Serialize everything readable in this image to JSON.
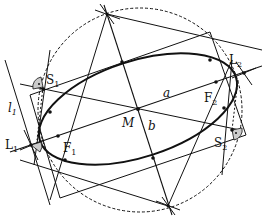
{
  "diagram": {
    "title": "",
    "colors": {
      "stroke": "#111111",
      "angle_fill": "#cccccc",
      "background": "#ffffff"
    },
    "labels": {
      "S1": {
        "main": "S",
        "sub": "1"
      },
      "S2": {
        "main": "S",
        "sub": "2"
      },
      "L1": {
        "main": "L",
        "sub": "1"
      },
      "L2": {
        "main": "L",
        "sub": "2"
      },
      "F1": {
        "main": "F",
        "sub": "1"
      },
      "F2": {
        "main": "F",
        "sub": "2"
      },
      "l1": {
        "main": "l",
        "sub": "1"
      },
      "M": "M",
      "a": "a",
      "b": "b"
    },
    "elements": [
      "ellipse",
      "dashed-circle",
      "major-axis-a",
      "minor-axis-b",
      "tangent-rectangle",
      "line-l1",
      "right-angle-S1",
      "right-angle-S2",
      "right-angle-L1"
    ]
  }
}
